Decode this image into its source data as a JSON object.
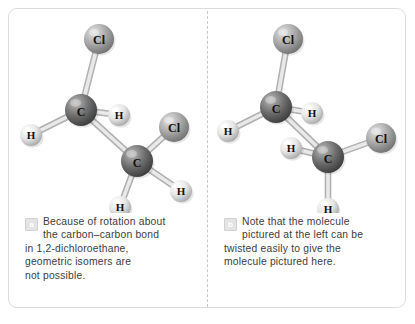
{
  "figure": {
    "background_color": "#ffffff",
    "frame_border_color": "#dcdcdc",
    "divider_style": "dashed",
    "divider_color": "#c8c8c8"
  },
  "atom_styles": {
    "C": {
      "label": "C",
      "radius": 16,
      "fill": "#6e6e6e",
      "highlight": "#b9b9b9",
      "shadow": "#3a3a3a",
      "text_color": "#111111"
    },
    "Cl": {
      "label": "Cl",
      "radius": 15,
      "fill": "#a8a8a8",
      "highlight": "#e2e2e2",
      "shadow": "#6f6f6f",
      "text_color": "#111111"
    },
    "H": {
      "label": "H",
      "radius": 11,
      "fill": "#e6e6e6",
      "highlight": "#ffffff",
      "shadow": "#a5a5a5",
      "text_color": "#111111"
    }
  },
  "bond_style": {
    "fill": "#e9e9e9",
    "stroke": "#b0b0b0",
    "width": 5
  },
  "panels": [
    {
      "id": "panel-a",
      "badge": "a",
      "molecule_name": "1,2-dichloroethane (anti conformation)",
      "caption_lines": [
        "Because of rotation about",
        "the carbon–carbon bond",
        "in 1,2-dichloroethane,",
        "geometric isomers are",
        "not possible."
      ],
      "molecule": {
        "atoms": [
          {
            "id": "cl1",
            "element": "Cl",
            "x": 90,
            "y": 26
          },
          {
            "id": "c1",
            "element": "C",
            "x": 72,
            "y": 97
          },
          {
            "id": "h1",
            "element": "H",
            "x": 110,
            "y": 102
          },
          {
            "id": "h2",
            "element": "H",
            "x": 22,
            "y": 122
          },
          {
            "id": "c2",
            "element": "C",
            "x": 128,
            "y": 148
          },
          {
            "id": "cl2",
            "element": "Cl",
            "x": 165,
            "y": 114
          },
          {
            "id": "h3",
            "element": "H",
            "x": 172,
            "y": 178
          },
          {
            "id": "h4",
            "element": "H",
            "x": 111,
            "y": 194
          }
        ],
        "bonds": [
          [
            "c1",
            "cl1"
          ],
          [
            "c1",
            "h1"
          ],
          [
            "c1",
            "h2"
          ],
          [
            "c1",
            "c2"
          ],
          [
            "c2",
            "cl2"
          ],
          [
            "c2",
            "h3"
          ],
          [
            "c2",
            "h4"
          ]
        ]
      }
    },
    {
      "id": "panel-b",
      "badge": "b",
      "molecule_name": "1,2-dichloroethane (twisted conformation)",
      "caption_lines": [
        "Note that the molecule",
        "pictured at the left can be",
        "twisted easily to give the",
        "molecule pictured here."
      ],
      "molecule": {
        "atoms": [
          {
            "id": "cl1",
            "element": "Cl",
            "x": 80,
            "y": 26
          },
          {
            "id": "c1",
            "element": "C",
            "x": 68,
            "y": 94
          },
          {
            "id": "h1",
            "element": "H",
            "x": 104,
            "y": 100
          },
          {
            "id": "h2",
            "element": "H",
            "x": 20,
            "y": 118
          },
          {
            "id": "c2",
            "element": "C",
            "x": 120,
            "y": 144
          },
          {
            "id": "cl2",
            "element": "Cl",
            "x": 173,
            "y": 125
          },
          {
            "id": "h3",
            "element": "H",
            "x": 83,
            "y": 135
          },
          {
            "id": "h4",
            "element": "H",
            "x": 120,
            "y": 196
          }
        ],
        "bonds": [
          [
            "c1",
            "cl1"
          ],
          [
            "c1",
            "h1"
          ],
          [
            "c1",
            "h2"
          ],
          [
            "c1",
            "c2"
          ],
          [
            "c2",
            "cl2"
          ],
          [
            "c2",
            "h3"
          ],
          [
            "c2",
            "h4"
          ]
        ]
      }
    }
  ]
}
